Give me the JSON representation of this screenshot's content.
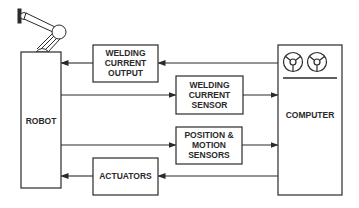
{
  "diagram": {
    "type": "block-diagram",
    "colors": {
      "line": "#2a2a2a",
      "background": "#ffffff"
    },
    "nodes": {
      "robot": {
        "label": "ROBOT",
        "icon": "robot-arm-icon"
      },
      "computer": {
        "label": "COMPUTER",
        "icon": "tape-reels-icon"
      },
      "welding_current_output": {
        "lines": [
          "WELDING",
          "CURRENT",
          "OUTPUT"
        ]
      },
      "welding_current_sensor": {
        "lines": [
          "WELDING",
          "CURRENT",
          "SENSOR"
        ]
      },
      "position_motion_sensors": {
        "lines": [
          "POSITION &",
          "MOTION",
          "SENSORS"
        ]
      },
      "actuators": {
        "label": "ACTUATORS"
      }
    },
    "edges": [
      {
        "from": "computer",
        "to": "welding_current_output"
      },
      {
        "from": "welding_current_output",
        "to": "robot"
      },
      {
        "from": "robot",
        "to": "welding_current_sensor"
      },
      {
        "from": "welding_current_sensor",
        "to": "computer"
      },
      {
        "from": "robot",
        "to": "position_motion_sensors"
      },
      {
        "from": "position_motion_sensors",
        "to": "computer"
      },
      {
        "from": "computer",
        "to": "actuators"
      },
      {
        "from": "actuators",
        "to": "robot"
      }
    ]
  }
}
